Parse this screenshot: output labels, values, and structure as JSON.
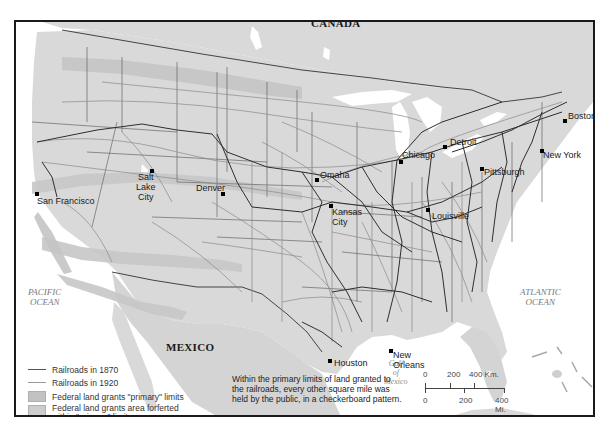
{
  "map": {
    "countries": [
      {
        "name": "CANADA"
      },
      {
        "name": "MEXICO"
      }
    ],
    "oceans": [
      {
        "line1": "PACIFIC",
        "line2": "OCEAN"
      },
      {
        "line1": "ATLANTIC",
        "line2": "OCEAN"
      }
    ],
    "gulf": {
      "line1": "Gulf",
      "line2": "of",
      "line3": "Mexico"
    },
    "cities": [
      {
        "name": "San Francisco"
      },
      {
        "name_l1": "Salt",
        "name_l2": "Lake",
        "name_l3": "City"
      },
      {
        "name": "Denver"
      },
      {
        "name": "Omaha"
      },
      {
        "name_l1": "Kansas",
        "name_l2": "City"
      },
      {
        "name": "Chicago"
      },
      {
        "name": "Detroit"
      },
      {
        "name": "Pittsburgh"
      },
      {
        "name": "Louisville"
      },
      {
        "name": "Boston"
      },
      {
        "name": "New York"
      },
      {
        "name": "Houston"
      },
      {
        "name_l1": "New",
        "name_l2": "Orleans"
      }
    ],
    "colors": {
      "land": "#d9d9d9",
      "grant_primary": "#c6c6c6",
      "grant_forfeited": "#cfcfcf",
      "water": "#ffffff",
      "rail_1870": "#333333",
      "rail_1920": "#8a8a8a",
      "border": "#1a1a1a"
    }
  },
  "legend": {
    "items": [
      {
        "label": "Railroads in 1870"
      },
      {
        "label": "Railroads in 1920"
      },
      {
        "label": "Federal land grants \"primary\" limits"
      },
      {
        "label_l1": "Federal land grants area forferted",
        "label_l2": "within \"primary\" limits"
      }
    ]
  },
  "note": {
    "line1": "Within the primary limits of land granted to",
    "line2": "the railroads, every other square mile was",
    "line3": "held by the public, in a checkerboard pattern."
  },
  "scale": {
    "km_ticks": [
      "0",
      "200",
      "400 Km."
    ],
    "mi_ticks": [
      "0",
      "200",
      "400 Mi."
    ]
  }
}
